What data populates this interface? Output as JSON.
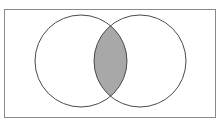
{
  "figure": {
    "type": "venn-2-set",
    "canvas": {
      "width": 220,
      "height": 124,
      "background": "#ffffff"
    },
    "clipped_caption": {
      "text": "",
      "note": "row of text cut off at top edge, illegible"
    }
  },
  "universal_set_rectangle": {
    "label": "",
    "x": 4.5,
    "y": 9.5,
    "width": 211,
    "height": 108,
    "stroke": "#8a8a8a",
    "stroke_width": 1,
    "fill": "#ffffff"
  },
  "circles": [
    {
      "name": "left-set",
      "label": "",
      "cx": 81,
      "cy": 61,
      "r": 46,
      "stroke": "#4a4a4a",
      "stroke_width": 1,
      "fill": "#ffffff"
    },
    {
      "name": "right-set",
      "label": "",
      "cx": 140,
      "cy": 61,
      "r": 46,
      "stroke": "#4a4a4a",
      "stroke_width": 1,
      "fill": "#ffffff"
    }
  ],
  "intersection": {
    "name": "intersection-lens",
    "label": "",
    "shaded": true,
    "fill": "#a8a8a8",
    "stroke": "#4a4a4a",
    "stroke_width": 1,
    "bounds": {
      "x_min": 100,
      "x_max": 126,
      "y_min": 30,
      "y_max": 92
    },
    "crossing_points": [
      {
        "x": 113,
        "y": 30
      },
      {
        "x": 113,
        "y": 92
      }
    ]
  },
  "colors": {
    "page_background": "#ffffff",
    "rectangle_stroke": "#8a8a8a",
    "circle_stroke": "#4a4a4a",
    "shade_fill": "#a8a8a8",
    "caption_text": "#c9c9c9"
  }
}
